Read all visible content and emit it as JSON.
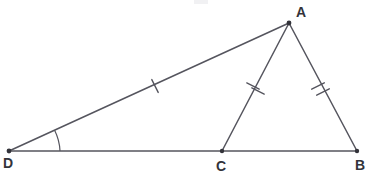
{
  "figure": {
    "background_color": "#ffffff",
    "stroke_color": "#55555e",
    "label_color": "#33333a",
    "width": 376,
    "height": 182
  },
  "vertices": [
    {
      "id": "A",
      "label": "A",
      "x": 289,
      "y": 23,
      "label_x": 301,
      "label_y": 13
    },
    {
      "id": "B",
      "label": "B",
      "x": 357,
      "y": 151,
      "label_x": 360,
      "label_y": 166
    },
    {
      "id": "C",
      "label": "C",
      "x": 222,
      "y": 151,
      "label_x": 221,
      "label_y": 167
    },
    {
      "id": "D",
      "label": "D",
      "x": 9,
      "y": 151,
      "label_x": 8,
      "label_y": 164
    }
  ],
  "segments": [
    {
      "id": "DA",
      "from": "D",
      "to": "A",
      "x1": 9,
      "y1": 151,
      "x2": 289,
      "y2": 23,
      "ticks": 1
    },
    {
      "id": "DB",
      "from": "D",
      "to": "B",
      "x1": 9,
      "y1": 151,
      "x2": 357,
      "y2": 151,
      "ticks": 0
    },
    {
      "id": "AC",
      "from": "A",
      "to": "C",
      "x1": 289,
      "y1": 23,
      "x2": 222,
      "y2": 151,
      "ticks": 2
    },
    {
      "id": "AB",
      "from": "A",
      "to": "B",
      "x1": 289,
      "y1": 23,
      "x2": 357,
      "y2": 151,
      "ticks": 2
    }
  ],
  "tick_marks": [
    {
      "id": "tick-DA-1",
      "segment": "DA",
      "cx": 155,
      "cy": 86,
      "angle_deg": -24.6,
      "half_len": 7
    },
    {
      "id": "tick-AC-1",
      "segment": "AC",
      "cx": 253,
      "cy": 86,
      "angle_deg": 62.4,
      "half_len": 7
    },
    {
      "id": "tick-AC-2",
      "segment": "AC",
      "cx": 258,
      "cy": 91,
      "angle_deg": 62.4,
      "half_len": 7
    },
    {
      "id": "tick-AB-1",
      "segment": "AB",
      "cx": 318,
      "cy": 86,
      "angle_deg": -62.0,
      "half_len": 7
    },
    {
      "id": "tick-AB-2",
      "segment": "AB",
      "cx": 323,
      "cy": 92,
      "angle_deg": -62.0,
      "half_len": 7
    }
  ],
  "angle_arcs": [
    {
      "id": "angle-D",
      "at_vertex": "D",
      "radius": 50,
      "path": "M 54.5 131.7 A 50 50 0 0 1 59 151"
    }
  ],
  "artifacts": [
    {
      "id": "top-smudge",
      "x": 194,
      "y": 0,
      "width": 14,
      "height": 4
    }
  ]
}
